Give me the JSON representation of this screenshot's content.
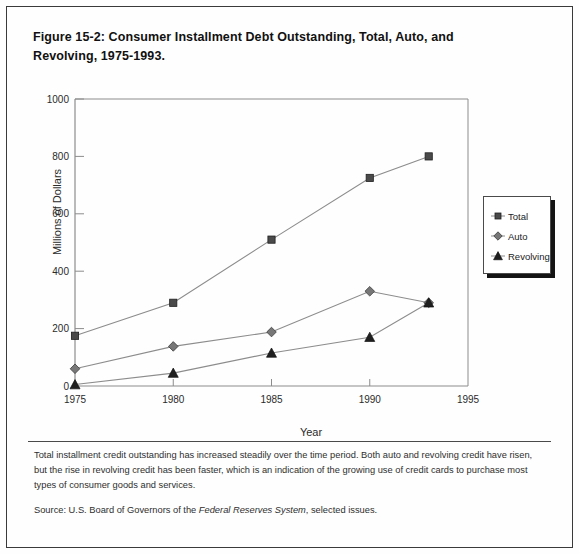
{
  "figure": {
    "title": "Figure 15-2: Consumer Installment Debt Outstanding, Total, Auto, and Revolving, 1975-1993."
  },
  "caption": {
    "body": "Total installment credit outstanding has increased steadily over the time period. Both auto and revolving credit have risen, but the rise in revolving credit has been faster, which is an indication of the growing use of credit cards to purchase most types of consumer goods and services.",
    "source_prefix": "Source:  U.S. Board of Governors of  the ",
    "source_italic": "Federal Reserves System",
    "source_suffix": ", selected issues."
  },
  "legend": {
    "items": [
      {
        "label": "Total",
        "marker": "square",
        "color": "#4a4a4a"
      },
      {
        "label": "Auto",
        "marker": "diamond",
        "color": "#777777"
      },
      {
        "label": "Revolving",
        "marker": "triangle",
        "color": "#1f1f1f"
      }
    ]
  },
  "chart_data": {
    "type": "line",
    "title": "Figure 15-2: Consumer Installment Debt Outstanding, Total, Auto, and Revolving, 1975-1993.",
    "xlabel": "Year",
    "ylabel": "Millions of Dollars",
    "x": [
      1975,
      1980,
      1985,
      1990,
      1993
    ],
    "xlim": [
      1975,
      1995
    ],
    "ylim": [
      0,
      1000
    ],
    "xticks": [
      1975,
      1980,
      1985,
      1990,
      1995
    ],
    "xtick_labels": [
      "1975",
      "1980",
      "1985",
      "1990",
      "1995"
    ],
    "yticks": [
      0,
      200,
      400,
      600,
      800,
      1000
    ],
    "ytick_labels": [
      "0",
      "200",
      "400",
      "600",
      "800",
      "1000"
    ],
    "grid": false,
    "legend_position": "right",
    "series": [
      {
        "name": "Total",
        "marker": "square",
        "color": "#4a4a4a",
        "values": [
          175,
          290,
          510,
          725,
          800
        ]
      },
      {
        "name": "Auto",
        "marker": "diamond",
        "color": "#777777",
        "values": [
          60,
          138,
          188,
          330,
          290
        ]
      },
      {
        "name": "Revolving",
        "marker": "triangle",
        "color": "#1f1f1f",
        "values": [
          5,
          45,
          115,
          170,
          290
        ]
      }
    ]
  }
}
